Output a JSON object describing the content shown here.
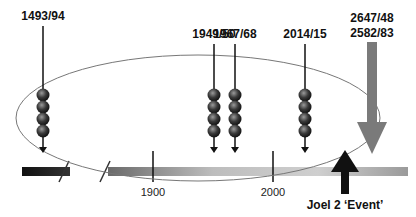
{
  "diagram": {
    "type": "timeline",
    "events": [
      {
        "id": "e1",
        "label": "1493/94",
        "spheres": 4
      },
      {
        "id": "e2",
        "label": "1949/50",
        "spheres": 4
      },
      {
        "id": "e3",
        "label": "1967/68",
        "spheres": 4
      },
      {
        "id": "e4",
        "label": "2014/15",
        "spheres": 4
      }
    ],
    "future": {
      "label_line1": "2647/48",
      "label_line2": "2582/83",
      "color": "#7a7a7a"
    },
    "axis": {
      "ticks": [
        {
          "label": "1900"
        },
        {
          "label": "2000"
        }
      ],
      "break_marks": 2
    },
    "event_marker": {
      "label": "Joel 2 ‘Event’",
      "color": "#111111"
    }
  }
}
